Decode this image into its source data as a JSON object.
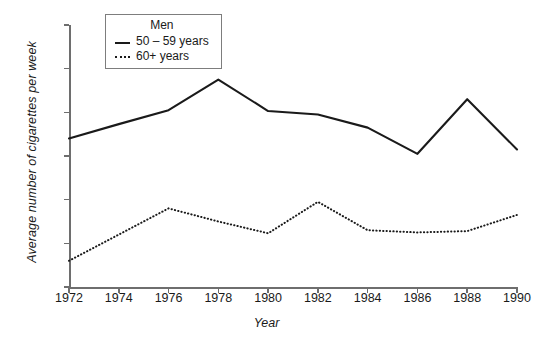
{
  "chart_data": {
    "type": "line",
    "title": "",
    "xlabel": "Year",
    "ylabel": "Average number of cigarettes per week",
    "x": [
      1972,
      1974,
      1976,
      1978,
      1980,
      1982,
      1984,
      1986,
      1988,
      1990
    ],
    "categories": [
      "1972",
      "1974",
      "1976",
      "1978",
      "1980",
      "1982",
      "1984",
      "1986",
      "1988",
      "1990"
    ],
    "xlim": [
      1972,
      1990
    ],
    "ylim": [
      90,
      150
    ],
    "yticks": [
      90,
      100,
      110,
      120,
      130,
      140,
      150
    ],
    "xticks": [
      1972,
      1974,
      1976,
      1978,
      1980,
      1982,
      1984,
      1986,
      1988,
      1990
    ],
    "grid": false,
    "legend_position": "top-left",
    "legend_title": "Men",
    "series": [
      {
        "name": "50 – 59 years",
        "style": "solid",
        "color": "#1a1a1a",
        "values": [
          124,
          127.3,
          130.5,
          137.5,
          130.3,
          129.5,
          126.5,
          120.5,
          133,
          121.5
        ]
      },
      {
        "name": "60+ years",
        "style": "dotted",
        "color": "#1a1a1a",
        "values": [
          96,
          102,
          108,
          105,
          102.3,
          109.5,
          103,
          102.5,
          102.8,
          106.5
        ]
      }
    ]
  },
  "legend": {
    "title": "Men",
    "entries": [
      {
        "label": "50 – 59 years",
        "style": "solid"
      },
      {
        "label": "60+ years",
        "style": "dotted"
      }
    ]
  },
  "axes": {
    "y_title": "Average number of cigarettes per week",
    "x_title": "Year",
    "y_tick_labels": [
      "150",
      "140",
      "130",
      "120",
      "110",
      "100",
      "90"
    ],
    "x_tick_labels": [
      "1972",
      "1974",
      "1976",
      "1978",
      "1980",
      "1982",
      "1984",
      "1986",
      "1988",
      "1990"
    ]
  },
  "colors": {
    "axis": "#6e6e6e",
    "line": "#1a1a1a",
    "background": "#ffffff",
    "legend_border": "#7d7d7d"
  }
}
